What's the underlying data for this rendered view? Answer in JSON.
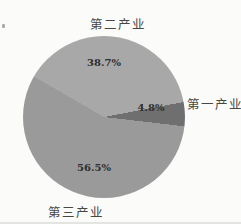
{
  "chart_data": {
    "type": "pie",
    "title": "",
    "legend": "none",
    "labels_outside_categories": true,
    "labels_inside_percent": true,
    "start_angle_deg": 300,
    "direction": "clockwise",
    "background": "#fbfbfa",
    "slices": [
      {
        "label": "第二产业",
        "value": 38.7,
        "display": "38.7%",
        "color": "#a8a8a8"
      },
      {
        "label": "第一产业",
        "value": 4.8,
        "display": "4.8%",
        "color": "#6f6f6f"
      },
      {
        "label": "第三产业",
        "value": 56.5,
        "display": "56.5%",
        "color": "#9a9a9a"
      }
    ]
  }
}
